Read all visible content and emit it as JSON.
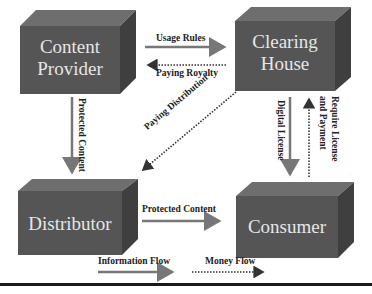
{
  "nodes": {
    "content_provider": {
      "line1": "Content",
      "line2": "Provider"
    },
    "clearing_house": {
      "line1": "Clearing",
      "line2": "House"
    },
    "distributor": {
      "line1": "Distributor"
    },
    "consumer": {
      "line1": "Consumer"
    }
  },
  "edges": {
    "usage_rules": "Usage Rules",
    "paying_royalty": "Paying Royalty",
    "protected_content_vertical": "Protected Content",
    "paying_distribution": "Paying Distribution",
    "digital_license": "Digital License",
    "require_license_line1": "Require License",
    "require_license_line2": "and Payment",
    "protected_content_horizontal": "Protected Content"
  },
  "legend": {
    "information_flow": "Information Flow",
    "money_flow": "Money Flow"
  },
  "colors": {
    "box_front": "#555555",
    "box_top": "#6e6e6e",
    "box_side": "#3f3f3f",
    "solid_arrow": "#777777",
    "dotted_arrow": "#333333",
    "box_text": "#e6e6e6"
  }
}
